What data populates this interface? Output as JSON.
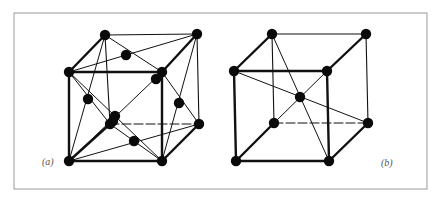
{
  "figure": {
    "frame": {
      "x": 14,
      "y": 13,
      "w": 413,
      "h": 176,
      "color": "#9a9a9a"
    },
    "colors": {
      "line": "#111111",
      "atom": "#0a0a0a",
      "caption": "#555555"
    },
    "panels": [
      {
        "id": "a",
        "label": "(a)",
        "label_pos": {
          "x": 42,
          "y": 156
        },
        "description": "face-centered cubic unit cell",
        "vertices": {
          "FTL": [
            69,
            72
          ],
          "FTR": [
            162,
            72
          ],
          "FBL": [
            69,
            161
          ],
          "FBR": [
            162,
            161
          ],
          "BTL": [
            105,
            35
          ],
          "BTR": [
            197,
            34
          ],
          "BBL": [
            110,
            124
          ],
          "BBR": [
            199,
            124
          ]
        },
        "edges_thick": [
          [
            "FTL",
            "FTR"
          ],
          [
            "FTR",
            "FBR"
          ],
          [
            "FBR",
            "FBL"
          ],
          [
            "FBL",
            "FTL"
          ],
          [
            "FTL",
            "BTL"
          ],
          [
            "FTR",
            "BTR"
          ],
          [
            "FBR",
            "BBR"
          ],
          [
            "FBL",
            "BBL"
          ]
        ],
        "edges_thin": [
          [
            "BTL",
            "BTR"
          ],
          [
            "BTR",
            "BBR"
          ],
          [
            "BTL",
            "BBL"
          ]
        ],
        "edges_dashed": [
          [
            "BBL",
            "BBR"
          ]
        ],
        "diagonals": [
          [
            "BTL",
            "FTR"
          ],
          [
            "FTL",
            "BTR"
          ],
          [
            "FTL",
            "FBR"
          ],
          [
            "FBL",
            "FTR"
          ],
          [
            "BTR",
            "FBR"
          ],
          [
            "FTR",
            "BBR"
          ],
          [
            "FBL",
            "BBR"
          ],
          [
            "FBL",
            "BBL"
          ],
          [
            "BTL",
            "FBL"
          ],
          [
            "FTL",
            "BBL"
          ],
          [
            "BBL",
            "FBR"
          ]
        ],
        "atoms": [
          [
            69,
            72
          ],
          [
            162,
            72
          ],
          [
            69,
            161
          ],
          [
            162,
            161
          ],
          [
            105,
            35
          ],
          [
            197,
            34
          ],
          [
            199,
            124
          ],
          [
            110,
            124
          ],
          [
            126,
            55
          ],
          [
            156,
            79
          ],
          [
            115,
            116
          ],
          [
            113,
            121
          ],
          [
            179,
            103
          ],
          [
            134,
            141
          ],
          [
            88,
            99
          ]
        ]
      },
      {
        "id": "b",
        "label": "(b)",
        "label_pos": {
          "x": 381,
          "y": 157
        },
        "description": "body-centered cubic unit cell",
        "vertices": {
          "FTL": [
            234,
            71
          ],
          "FTR": [
            327,
            71
          ],
          "FBL": [
            236,
            161
          ],
          "FBR": [
            329,
            161
          ],
          "BTL": [
            272,
            34
          ],
          "BTR": [
            366,
            34
          ],
          "BBL": [
            274,
            123
          ],
          "BBR": [
            368,
            123
          ]
        },
        "edges_thick": [
          [
            "FTL",
            "FTR"
          ],
          [
            "FTR",
            "FBR"
          ],
          [
            "FBR",
            "FBL"
          ],
          [
            "FBL",
            "FTL"
          ],
          [
            "FTL",
            "BTL"
          ],
          [
            "FTR",
            "BTR"
          ],
          [
            "FBR",
            "BBR"
          ],
          [
            "FBL",
            "BBL"
          ]
        ],
        "edges_thin": [
          [
            "BTL",
            "BTR"
          ],
          [
            "BTR",
            "BBR"
          ],
          [
            "BTL",
            "BBL"
          ]
        ],
        "edges_dashed": [
          [
            "BBL",
            "BBR"
          ]
        ],
        "diagonals": [
          [
            "BTL",
            "FBR"
          ],
          [
            "FTL",
            "BBR"
          ],
          [
            "FTR",
            "BBL"
          ]
        ],
        "atoms": [
          [
            234,
            71
          ],
          [
            327,
            71
          ],
          [
            236,
            161
          ],
          [
            329,
            161
          ],
          [
            272,
            34
          ],
          [
            366,
            34
          ],
          [
            274,
            123
          ],
          [
            368,
            123
          ],
          [
            300,
            97
          ]
        ]
      }
    ]
  }
}
